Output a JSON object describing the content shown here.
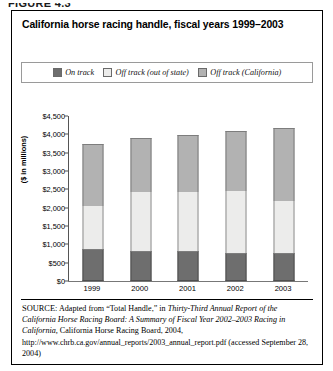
{
  "figure_label": "FIGURE 4.3",
  "title": "California horse racing handle, fiscal years 1999–2003",
  "legend": {
    "items": [
      {
        "label": "On track",
        "color": "#6e6e6e",
        "icon": "legend-swatch-icon"
      },
      {
        "label": "Off track (out of state)",
        "color": "#ececeb",
        "icon": "legend-swatch-icon"
      },
      {
        "label": "Off track (California)",
        "color": "#b2b2b2",
        "icon": "legend-swatch-icon"
      }
    ]
  },
  "axis": {
    "ylabel": "($ in millions)",
    "yticks": [
      "$4,500",
      "$4,000",
      "$3,500",
      "$3,000",
      "$2,500",
      "$2,000",
      "$1,500",
      "$1,000",
      "$500",
      "$0"
    ],
    "xticks": [
      "1999",
      "2000",
      "2001",
      "2002",
      "2003"
    ]
  },
  "source": {
    "prefix": "SOURCE:",
    "text_1": " Adapted from “Total Handle,” in ",
    "italic_1": "Thirty-Third Annual Report of the California Horse Racing Board: A Summary of Fiscal Year 2002–2003 Racing in California,",
    "text_2": " California Horse Racing Board, 2004,",
    "url": "http://www.chrb.ca.gov/annual_reports/2003_annual_report.pdf",
    "text_3": "(accessed September 28, 2004)"
  },
  "chart_data": {
    "type": "bar",
    "subtype": "stacked-vertical",
    "title": "California horse racing handle, fiscal years 1999–2003",
    "xlabel": "",
    "ylabel": "($ in millions)",
    "ylim": [
      0,
      4500
    ],
    "ytick_step": 500,
    "grid": false,
    "legend_position": "top",
    "categories": [
      "1999",
      "2000",
      "2001",
      "2002",
      "2003"
    ],
    "series": [
      {
        "name": "On track",
        "color": "#6e6e6e",
        "values": [
          875,
          820,
          820,
          765,
          765
        ]
      },
      {
        "name": "Off track (out of state)",
        "color": "#ececeb",
        "values": [
          1175,
          1610,
          1610,
          1690,
          1420
        ]
      },
      {
        "name": "Off track (California)",
        "color": "#b2b2b2",
        "values": [
          1690,
          1475,
          1555,
          1635,
          1990
        ]
      }
    ],
    "totals": [
      3740,
      3905,
      3985,
      4090,
      4175
    ]
  }
}
